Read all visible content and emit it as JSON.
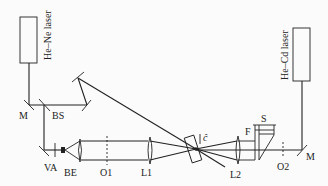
{
  "diagram": {
    "type": "optical-setup",
    "lasers": [
      {
        "id": "hene",
        "label": "He–Ne laser"
      },
      {
        "id": "hecd",
        "label": "He–Cd laser"
      }
    ],
    "components": {
      "M_left": "M",
      "BS": "BS",
      "VA": "VA",
      "BE": "BE",
      "O1": "O1",
      "L1": "L1",
      "crystal_axis": "ĉ",
      "L2": "L2",
      "F": "F",
      "S": "S",
      "O2": "O2",
      "M_right": "M"
    },
    "colors": {
      "line": "#222222",
      "background": "#fbfbfb"
    }
  }
}
